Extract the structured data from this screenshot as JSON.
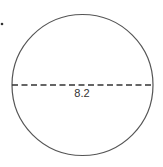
{
  "diagram": {
    "shape": "circle",
    "diameter_label": "8.2",
    "colors": {
      "stroke": "#555555",
      "dashed_line": "#333333",
      "text": "#333333",
      "background": "#ffffff"
    }
  }
}
